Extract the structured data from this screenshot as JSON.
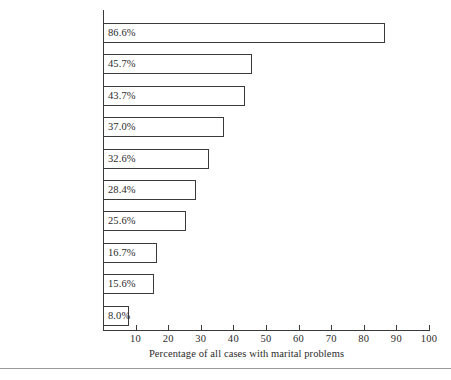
{
  "chart_data": {
    "type": "bar",
    "orientation": "horizontal",
    "title": "",
    "xlabel": "Percentage of all cases with marital problems",
    "ylabel": "",
    "xlim": [
      0,
      100
    ],
    "xticks": [
      10,
      20,
      30,
      40,
      50,
      60,
      70,
      80,
      90,
      100
    ],
    "xtick_labels": [
      "10",
      "20",
      "30",
      "40",
      "50",
      "60",
      "70",
      "80",
      "90",
      "100"
    ],
    "grid": false,
    "legend": null,
    "categories": [
      "Communication",
      "Children",
      "Sex",
      "Money",
      "Leisure",
      "Relatives",
      "Infidelity",
      "Housekeeping",
      "Physical abuse",
      "Other problems"
    ],
    "values": [
      86.6,
      45.7,
      43.7,
      37.0,
      32.6,
      28.4,
      25.6,
      16.7,
      15.6,
      8.0
    ],
    "value_labels": [
      "86.6%",
      "45.7%",
      "43.7%",
      "37.0%",
      "32.6%",
      "28.4%",
      "25.6%",
      "16.7%",
      "15.6%",
      "8.0%"
    ],
    "colors": {
      "bar_fill": "#ffffff",
      "bar_stroke": "#3a3a3a",
      "axis": "#3a3a3a",
      "text": "#2b2b2b",
      "background": "#ffffff",
      "rule": "#9a9a9a"
    }
  }
}
